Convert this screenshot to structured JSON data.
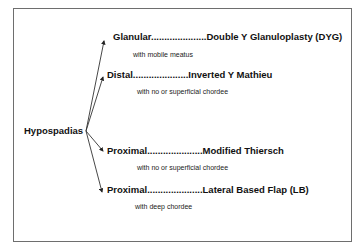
{
  "diagram": {
    "root": "Hypospadias",
    "branches": [
      {
        "label": "Glanular.....................Double Y Glanuloplasty (DYG)",
        "note": "with mobile meatus"
      },
      {
        "label": "Distal.....................Inverted Y Mathieu",
        "note": "with no or superficial chordee"
      },
      {
        "label": "Proximal.....................Modified Thiersch",
        "note": "with no or superficial chordee"
      },
      {
        "label": "Proximal.....................Lateral Based Flap (LB)",
        "note": "with deep chordee"
      }
    ]
  }
}
